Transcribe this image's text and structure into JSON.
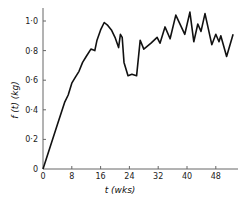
{
  "chart_data": {
    "type": "line",
    "title": "",
    "xlabel": "t (wks)",
    "ylabel": "f (t) (kg)",
    "xlim": [
      0,
      56
    ],
    "ylim": [
      0,
      1.05
    ],
    "grid": false,
    "legend": null,
    "x_ticks": [
      0,
      8,
      16,
      24,
      32,
      40,
      48
    ],
    "x_tick_labels": [
      "0",
      "8",
      "16",
      "24",
      "32",
      "40",
      "48"
    ],
    "y_ticks": [
      0,
      0.2,
      0.4,
      0.6,
      0.8,
      1.0
    ],
    "y_tick_labels": [
      "0",
      "0·2",
      "0·4",
      "0·6",
      "0·8",
      "1·0"
    ],
    "series": [
      {
        "name": "f(t)",
        "color": "#111111",
        "x": [
          0,
          2,
          4,
          6,
          7,
          8,
          9,
          10,
          11,
          12,
          13.3,
          14.4,
          15,
          16,
          17,
          18,
          19,
          20,
          21,
          21.5,
          22,
          22.5,
          23.6,
          24.7,
          26,
          27,
          28,
          30,
          31.7,
          32.5,
          33.9,
          35.3,
          36.9,
          39.4,
          40.8,
          41.9,
          43,
          43.9,
          45,
          46.9,
          48,
          48.9,
          49.4,
          51,
          52.8
        ],
        "values": [
          0,
          0.15,
          0.3,
          0.45,
          0.5,
          0.58,
          0.62,
          0.66,
          0.72,
          0.76,
          0.81,
          0.8,
          0.87,
          0.94,
          0.99,
          0.97,
          0.94,
          0.89,
          0.82,
          0.91,
          0.89,
          0.72,
          0.63,
          0.64,
          0.63,
          0.87,
          0.81,
          0.85,
          0.89,
          0.85,
          0.96,
          0.88,
          1.04,
          0.91,
          1.06,
          0.86,
          0.98,
          0.93,
          1.05,
          0.84,
          0.91,
          0.86,
          0.9,
          0.76,
          0.91
        ]
      }
    ]
  },
  "labels": {
    "x_axis_title": "t (wks)",
    "y_axis_title": "f (t) (kg)"
  }
}
